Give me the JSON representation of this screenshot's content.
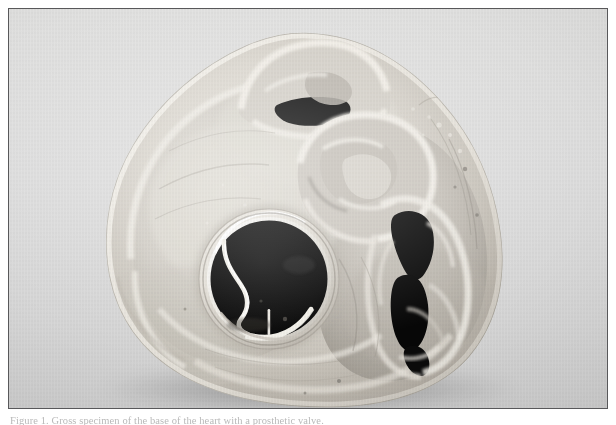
{
  "figure": {
    "kind": "gross-pathology-photograph",
    "modality": "black-and-white photograph",
    "caption_text": "Figure 1. Gross specimen of the base of the heart with a prosthetic valve.",
    "border_color": "#58585a",
    "backdrop_color": "#dcdcdc",
    "page_color": "#ffffff"
  },
  "specimen": {
    "title": "Base of heart, short-axis section",
    "description": "Formalin-fixed heart specimen sectioned at the level of the cardiac base, viewed from above, showing a mechanical prosthetic valve seated in the mitral position.",
    "tissue_highlight_color": "#e9e7e1",
    "tissue_midtone_color": "#c3bfb7",
    "tissue_shadow_color": "#8d8880",
    "cavity_color": "#0a0a0a",
    "metal_color": "#f4f2ec",
    "structures": [
      {
        "name": "prosthetic-valve",
        "label": "Mechanical prosthetic valve (mitral position)",
        "center_x": 260,
        "center_y": 270,
        "radius": 61,
        "ring_color": "#ece9e2",
        "orifice_color": "#070707",
        "occluder_label": "Tilting-disc occluder"
      },
      {
        "name": "aortic-outflow-orifice",
        "label": "Aortic valve / outflow orifice",
        "center_x": 330,
        "center_y": 150
      },
      {
        "name": "superior-chamber-orifice",
        "label": "Superior orifice (pulmonary / atrial chamber)",
        "center_x": 290,
        "center_y": 70
      },
      {
        "name": "right-chamber-cavity",
        "label": "Right-sided chamber cavity",
        "center_x": 415,
        "center_y": 255
      },
      {
        "name": "myocardial-wall",
        "label": "Myocardial wall"
      },
      {
        "name": "epicardial-fat",
        "label": "Epicardial surface"
      }
    ]
  }
}
